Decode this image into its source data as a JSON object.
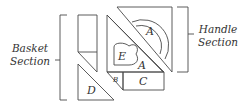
{
  "diagram": {
    "type": "quilt-block-assembly",
    "sections": {
      "basket": {
        "line1": "Basket",
        "line2": "Section"
      },
      "handle": {
        "line1": "Handle",
        "line2": "Section"
      }
    },
    "pieces": {
      "handle_a": "A",
      "body_a": "A",
      "e": "E",
      "b": "B",
      "c": "C",
      "d": "D"
    },
    "colors": {
      "line": "#4a4a4a",
      "text": "#333333",
      "background": "#ffffff"
    }
  }
}
